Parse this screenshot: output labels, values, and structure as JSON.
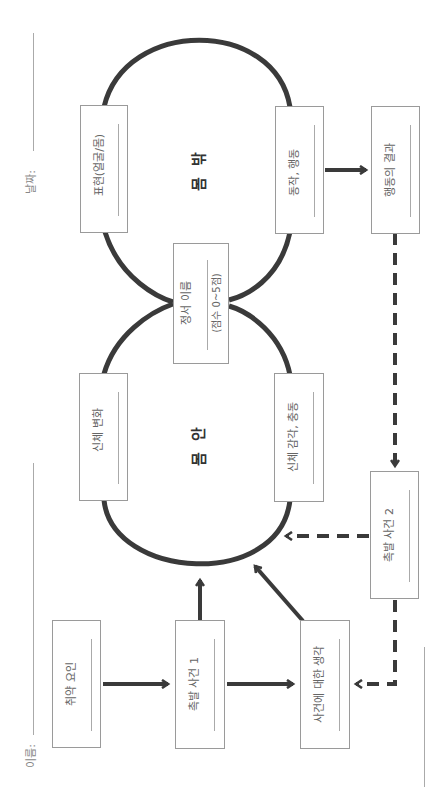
{
  "header": {
    "name_label": "이름:",
    "date_label": "날짜:"
  },
  "circles": {
    "outside_body": "몸 밖",
    "inside_body": "몸 안"
  },
  "boxes": {
    "expression": "표현(얼굴/몸)",
    "action": "동작, 행동",
    "consequence": "행동의 결과",
    "emotion_name": "정서 이름",
    "emotion_score": "(점수 0~5점)",
    "body_change": "신체 변화",
    "body_sensation": "신체 감각, 충동",
    "trigger_event_2": "촉발 사건 2",
    "vulnerability": "취약 요인",
    "trigger_event_1": "촉발 사건 1",
    "thoughts": "사건에 대한 생각"
  },
  "colors": {
    "line": "#3a3a3a",
    "box_border": "#9a9a9a",
    "text": "#666666"
  }
}
